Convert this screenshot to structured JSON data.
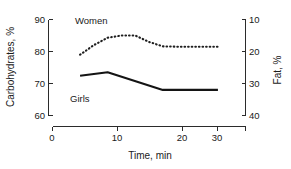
{
  "chart_data": {
    "type": "line",
    "title": "",
    "subtitle": "",
    "xlabel": "Time, min",
    "ylabel": "Carbohydrates, %",
    "y2label": "Fat, %",
    "xlim": [
      0,
      35
    ],
    "ylim": [
      60,
      90
    ],
    "y2lim": [
      40,
      10
    ],
    "xticks": [
      "0",
      "10",
      "20",
      "30"
    ],
    "xtick_values": [
      0,
      10,
      20,
      30
    ],
    "yticks": [
      "90",
      "80",
      "70",
      "60"
    ],
    "ytick_values": [
      90,
      80,
      70,
      60
    ],
    "y2ticks": [
      "10",
      "20",
      "30",
      "40"
    ],
    "y2tick_values": [
      10,
      20,
      30,
      40
    ],
    "grid": false,
    "legend_position": "inline-annotation",
    "series": [
      {
        "name": "Women",
        "style": "dotted",
        "annotation": "Women",
        "x": [
          5,
          7.5,
          10,
          12.5,
          15,
          17.5,
          20,
          22.5,
          25,
          27.5,
          30
        ],
        "values": [
          79.0,
          82.0,
          84.3,
          85.0,
          85.0,
          83.0,
          81.6,
          81.5,
          81.5,
          81.5,
          81.5
        ]
      },
      {
        "name": "Girls",
        "style": "solid",
        "annotation": "Girls",
        "x": [
          5,
          10,
          20,
          30
        ],
        "values": [
          72.4,
          73.5,
          68.0,
          68.0
        ]
      }
    ]
  },
  "annotations": {
    "women_label": "Women",
    "girls_label": "Girls"
  },
  "colors": {
    "axis": "#2b2b2b",
    "solid_series": "#141414",
    "dotted_series": "#1f1f1f",
    "background": "#ffffff"
  }
}
